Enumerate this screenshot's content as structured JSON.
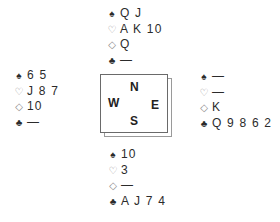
{
  "suit_symbols": {
    "spades": "♠",
    "hearts": "♡",
    "diamonds": "◇",
    "clubs": "♣"
  },
  "hands": {
    "north": {
      "spades": "Q J",
      "hearts": "A K 10",
      "diamonds": "Q",
      "clubs": "—"
    },
    "west": {
      "spades": "6 5",
      "hearts": "J 8 7",
      "diamonds": "10",
      "clubs": "—"
    },
    "east": {
      "spades": "—",
      "hearts": "—",
      "diamonds": "K",
      "clubs": "Q 9 8 6 2"
    },
    "south": {
      "spades": "10",
      "hearts": "3",
      "diamonds": "—",
      "clubs": "A J 7 4"
    }
  },
  "compass": {
    "north": "N",
    "west": "W",
    "east": "E",
    "south": "S"
  },
  "colors": {
    "text": "#2b2b2b",
    "red_suit_outline": "#8a8a8a",
    "box_border": "#6a6a6a"
  }
}
